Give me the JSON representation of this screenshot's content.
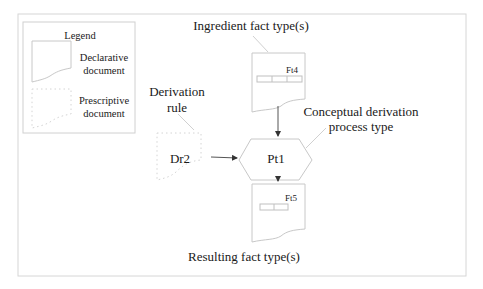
{
  "legend": {
    "title": "Legend",
    "items": [
      {
        "shape": "declarative-document",
        "line1": "Declarative",
        "line2": "document"
      },
      {
        "shape": "prescriptive-document",
        "line1": "Prescriptive",
        "line2": "document"
      }
    ]
  },
  "nodes": {
    "ingredient": {
      "id": "Ft4",
      "caption": "Ingredient fact type(s)"
    },
    "rule": {
      "id": "Dr2",
      "caption_line1": "Derivation",
      "caption_line2": "rule"
    },
    "process": {
      "id": "Pt1",
      "caption_line1": "Conceptual derivation",
      "caption_line2": "process type"
    },
    "result": {
      "id": "Ft5",
      "caption": "Resulting fact type(s)"
    }
  },
  "colors": {
    "frame": "#d6d6d6",
    "shape_stroke": "#c8c8c8",
    "arrow": "#333333",
    "text": "#1a1a1a"
  }
}
